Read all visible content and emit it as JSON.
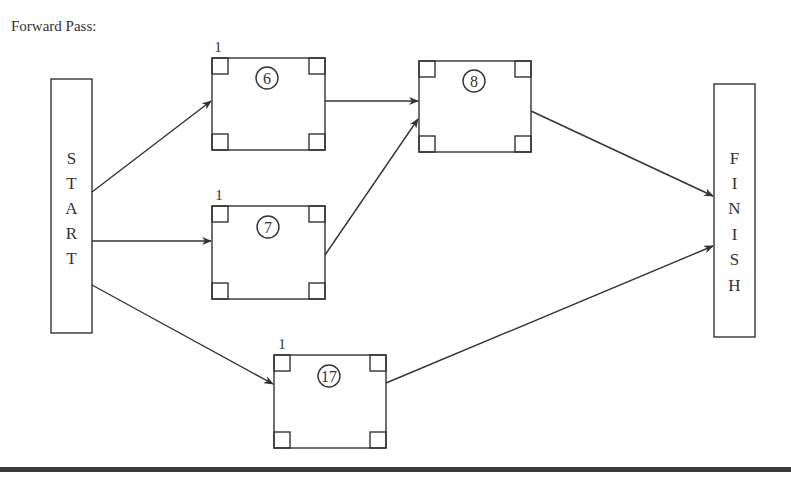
{
  "title": "Forward Pass:",
  "start": {
    "label": "START",
    "letters": [
      "S",
      "T",
      "A",
      "R",
      "T"
    ]
  },
  "finish": {
    "label": "FINISH",
    "letters": [
      "F",
      "I",
      "N",
      "I",
      "S",
      "H"
    ]
  },
  "activities": [
    {
      "id": "6",
      "duration_label": "6",
      "early_start": "1"
    },
    {
      "id": "7",
      "duration_label": "7",
      "early_start": "1"
    },
    {
      "id": "8",
      "duration_label": "8",
      "early_start": ""
    },
    {
      "id": "17",
      "duration_label": "17",
      "early_start": "1"
    }
  ],
  "edges": [
    [
      "START",
      "6"
    ],
    [
      "START",
      "7"
    ],
    [
      "START",
      "17"
    ],
    [
      "6",
      "8"
    ],
    [
      "7",
      "8"
    ],
    [
      "8",
      "FINISH"
    ],
    [
      "17",
      "FINISH"
    ]
  ]
}
